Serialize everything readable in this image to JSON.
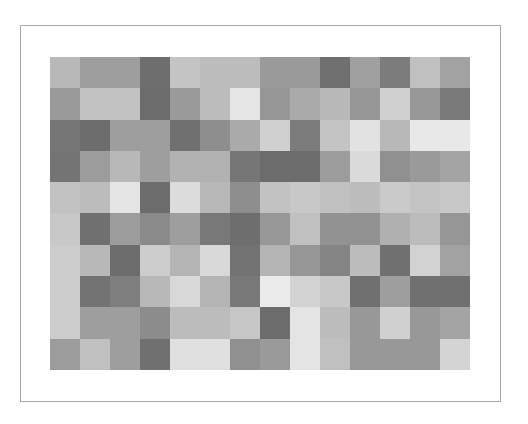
{
  "mosaic": {
    "columns": 14,
    "rows": 10,
    "frame_color": "#a8a8a8",
    "cells": [
      [
        "#b8b8b8",
        "#9e9e9e",
        "#9e9e9e",
        "#6e6e6e",
        "#c4c4c4",
        "#bcbcbc",
        "#bcbcbc",
        "#9a9a9a",
        "#9a9a9a",
        "#707070",
        "#a0a0a0",
        "#7c7c7c",
        "#c0c0c0",
        "#a2a2a2"
      ],
      [
        "#9a9a9a",
        "#c2c2c2",
        "#c2c2c2",
        "#6c6c6c",
        "#9a9a9a",
        "#bcbcbc",
        "#e6e6e6",
        "#969696",
        "#aaaaaa",
        "#b8b8b8",
        "#969696",
        "#d0d0d0",
        "#989898",
        "#7a7a7a"
      ],
      [
        "#767676",
        "#6c6c6c",
        "#9e9e9e",
        "#9e9e9e",
        "#707070",
        "#8e8e8e",
        "#aaaaaa",
        "#d0d0d0",
        "#7c7c7c",
        "#c4c4c4",
        "#e2e2e2",
        "#b8b8b8",
        "#e8e8e8",
        "#e8e8e8"
      ],
      [
        "#747474",
        "#9c9c9c",
        "#b8b8b8",
        "#9e9e9e",
        "#b2b2b2",
        "#b2b2b2",
        "#767676",
        "#6c6c6c",
        "#6c6c6c",
        "#9c9c9c",
        "#dadada",
        "#909090",
        "#9a9a9a",
        "#a4a4a4"
      ],
      [
        "#c2c2c2",
        "#bcbcbc",
        "#e4e4e4",
        "#6c6c6c",
        "#dcdcdc",
        "#b8b8b8",
        "#8e8e8e",
        "#c2c2c2",
        "#c8c8c8",
        "#c0c0c0",
        "#bcbcbc",
        "#cacaca",
        "#c4c4c4",
        "#c8c8c8"
      ],
      [
        "#c8c8c8",
        "#707070",
        "#9c9c9c",
        "#8a8a8a",
        "#9e9e9e",
        "#787878",
        "#6e6e6e",
        "#989898",
        "#c0c0c0",
        "#929292",
        "#929292",
        "#b0b0b0",
        "#bcbcbc",
        "#969696"
      ],
      [
        "#cccccc",
        "#b8b8b8",
        "#6c6c6c",
        "#cccccc",
        "#b4b4b4",
        "#d8d8d8",
        "#727272",
        "#b4b4b4",
        "#969696",
        "#848484",
        "#bcbcbc",
        "#707070",
        "#d2d2d2",
        "#a2a2a2"
      ],
      [
        "#cccccc",
        "#727272",
        "#7e7e7e",
        "#b8b8b8",
        "#d8d8d8",
        "#b4b4b4",
        "#787878",
        "#eaeaea",
        "#d2d2d2",
        "#c8c8c8",
        "#707070",
        "#9e9e9e",
        "#707070",
        "#707070"
      ],
      [
        "#cccccc",
        "#9e9e9e",
        "#9e9e9e",
        "#8c8c8c",
        "#bcbcbc",
        "#bcbcbc",
        "#c6c6c6",
        "#6c6c6c",
        "#e4e4e4",
        "#bcbcbc",
        "#989898",
        "#d0d0d0",
        "#989898",
        "#a4a4a4"
      ],
      [
        "#9c9c9c",
        "#c0c0c0",
        "#9e9e9e",
        "#707070",
        "#e0e0e0",
        "#e0e0e0",
        "#909090",
        "#9a9a9a",
        "#e4e4e4",
        "#c0c0c0",
        "#989898",
        "#989898",
        "#989898",
        "#d4d4d4"
      ]
    ]
  }
}
